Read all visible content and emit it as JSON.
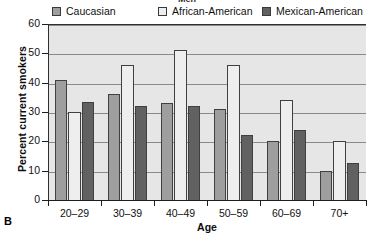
{
  "panel_label": "B",
  "title_partial": "Men",
  "legend": {
    "items": [
      {
        "label": "Caucasian",
        "color": "#9e9e9e",
        "swatch_icon": "legend-swatch-icon"
      },
      {
        "label": "African-American",
        "color": "#eeeeee",
        "swatch_icon": "legend-swatch-icon"
      },
      {
        "label": "Mexican-American",
        "color": "#616161",
        "swatch_icon": "legend-swatch-icon"
      }
    ]
  },
  "chart_data": {
    "type": "bar",
    "title": "Men",
    "xlabel": "Age",
    "ylabel": "Percent current smokers",
    "categories": [
      "20–29",
      "30–39",
      "40–49",
      "50–59",
      "60–69",
      "70+"
    ],
    "series": [
      {
        "name": "Caucasian",
        "color": "#9e9e9e",
        "values": [
          41,
          36,
          33,
          31,
          20,
          10
        ]
      },
      {
        "name": "African-American",
        "color": "#eeeeee",
        "values": [
          30,
          46,
          51,
          46,
          34,
          20
        ]
      },
      {
        "name": "Mexican-American",
        "color": "#616161",
        "values": [
          33.5,
          32,
          32,
          22,
          24,
          12.5
        ]
      }
    ],
    "ylim": [
      0,
      60
    ],
    "yticks": [
      0,
      10,
      20,
      30,
      40,
      50,
      60
    ],
    "ytick_labels": [
      "0",
      "10",
      "20",
      "30",
      "40",
      "50",
      "60"
    ],
    "grid": true,
    "legend_position": "top",
    "plot_background": "#e6e6e6"
  }
}
